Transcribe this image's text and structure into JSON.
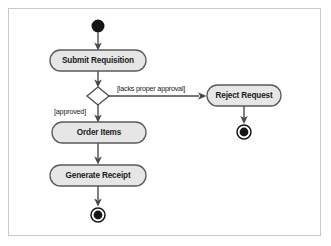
{
  "diagram": {
    "type": "uml-activity-diagram",
    "title": "",
    "background_color": "#ffffff",
    "frame_border_color": "#c9c9c9",
    "node_fill_color": "#e6e6e6",
    "node_stroke_color": "#5a5a5a",
    "marker_color": "#161616",
    "flow_color": "#4a4a4a",
    "text_color": "#1a1a1a",
    "nodes": [
      {
        "id": "initial",
        "kind": "initial-node",
        "label": "",
        "cx": 98,
        "cy": 26,
        "r": 6.5
      },
      {
        "id": "submit-requisition",
        "kind": "activity",
        "label": "Submit Requisition",
        "x": 50,
        "y": 50,
        "w": 96,
        "h": 21
      },
      {
        "id": "decision",
        "kind": "decision-node",
        "label": "",
        "cx": 98,
        "cy": 96,
        "rx": 11,
        "ry": 9
      },
      {
        "id": "reject-request",
        "kind": "activity",
        "label": "Reject Request",
        "x": 207,
        "y": 85,
        "w": 74,
        "h": 21
      },
      {
        "id": "reject-final",
        "kind": "final-node",
        "label": "",
        "cx": 244,
        "cy": 132,
        "r_outer": 7.5,
        "r_inner": 4.6
      },
      {
        "id": "order-items",
        "kind": "activity",
        "label": "Order Items",
        "x": 52,
        "y": 122,
        "w": 94,
        "h": 21
      },
      {
        "id": "generate-receipt",
        "kind": "activity",
        "label": "Generate Receipt",
        "x": 50,
        "y": 165,
        "w": 96,
        "h": 21
      },
      {
        "id": "main-final",
        "kind": "final-node",
        "label": "",
        "cx": 98,
        "cy": 215,
        "r_outer": 7.5,
        "r_inner": 4.6
      }
    ],
    "flows": [
      {
        "id": "flow-initial-to-submit",
        "from": "initial",
        "to": "submit-requisition",
        "guard": ""
      },
      {
        "id": "flow-submit-to-decision",
        "from": "submit-requisition",
        "to": "decision",
        "guard": ""
      },
      {
        "id": "flow-decision-to-reject",
        "from": "decision",
        "to": "reject-request",
        "guard": "[lacks proper approval]",
        "guard_x": 117,
        "guard_y": 89
      },
      {
        "id": "flow-reject-to-final",
        "from": "reject-request",
        "to": "reject-final",
        "guard": ""
      },
      {
        "id": "flow-decision-to-order",
        "from": "decision",
        "to": "order-items",
        "guard": "[approved]",
        "guard_x": 54,
        "guard_y": 112
      },
      {
        "id": "flow-order-to-receipt",
        "from": "order-items",
        "to": "generate-receipt",
        "guard": ""
      },
      {
        "id": "flow-receipt-to-final",
        "from": "generate-receipt",
        "to": "main-final",
        "guard": ""
      }
    ]
  }
}
